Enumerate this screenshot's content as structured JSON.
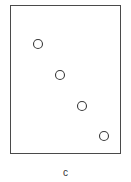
{
  "figure": {
    "caption": "c",
    "frame_color": "#4a4a4a",
    "marker_color": "#3a3a3a"
  },
  "chart_data": {
    "type": "scatter",
    "title": "",
    "xlabel": "",
    "ylabel": "",
    "caption": "c",
    "grid": false,
    "marker": "open-circle",
    "points_px": [
      {
        "x": 38,
        "y": 44
      },
      {
        "x": 60,
        "y": 75
      },
      {
        "x": 82,
        "y": 106
      },
      {
        "x": 104,
        "y": 136
      }
    ],
    "trend": "decreasing, evenly spaced diagonal from upper-left to lower-right"
  }
}
